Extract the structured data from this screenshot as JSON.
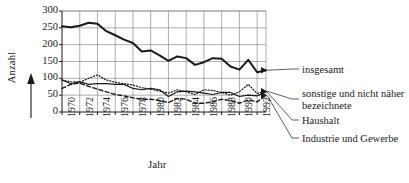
{
  "chart_data": {
    "type": "line",
    "title": "",
    "xlabel": "Jahr",
    "ylabel": "Anzahl",
    "xlim": [
      1970,
      1993
    ],
    "ylim": [
      0,
      300
    ],
    "yticks": [
      0,
      50,
      100,
      150,
      200,
      250,
      300
    ],
    "xticks": [
      1970,
      1972,
      1974,
      1976,
      1978,
      1980,
      1982,
      1984,
      1986,
      1988,
      1990,
      1992
    ],
    "grid": true,
    "legend_position": "right",
    "x": [
      1970,
      1971,
      1972,
      1973,
      1974,
      1975,
      1976,
      1977,
      1978,
      1979,
      1980,
      1981,
      1982,
      1983,
      1984,
      1985,
      1986,
      1987,
      1988,
      1989,
      1990,
      1991,
      1992,
      1993
    ],
    "series": [
      {
        "name": "insgesamt",
        "style": "solid-thick",
        "values": [
          255,
          252,
          256,
          265,
          262,
          240,
          228,
          215,
          205,
          180,
          183,
          168,
          152,
          165,
          160,
          140,
          148,
          160,
          158,
          135,
          126,
          155,
          118,
          124
        ]
      },
      {
        "name": "sonstige und nicht näher bezeichnete",
        "style": "dotted",
        "values": [
          95,
          90,
          88,
          100,
          110,
          95,
          88,
          84,
          80,
          72,
          68,
          62,
          56,
          66,
          60,
          52,
          66,
          64,
          58,
          50,
          60,
          82,
          55,
          62
        ]
      },
      {
        "name": "Haushalt",
        "style": "solid-thin",
        "values": [
          95,
          84,
          90,
          82,
          84,
          84,
          82,
          82,
          70,
          66,
          70,
          66,
          46,
          60,
          62,
          60,
          56,
          52,
          58,
          58,
          46,
          50,
          48,
          60
        ]
      },
      {
        "name": "Industrie und Gewerbe",
        "style": "dashed",
        "values": [
          70,
          82,
          86,
          76,
          68,
          60,
          52,
          48,
          42,
          38,
          38,
          34,
          28,
          40,
          38,
          26,
          26,
          30,
          38,
          34,
          26,
          36,
          30,
          50
        ]
      }
    ]
  },
  "axis": {
    "ylabel": "Anzahl",
    "xlabel": "Jahr",
    "yticks": [
      "300",
      "250",
      "200",
      "150",
      "100",
      "50",
      "0"
    ],
    "xticks": [
      "1970",
      "1972",
      "1974",
      "1976",
      "1978",
      "1980",
      "1982",
      "1984",
      "1986",
      "1988",
      "1990",
      "1992"
    ]
  },
  "legend": {
    "items": [
      {
        "label": "insgesamt"
      },
      {
        "label": "sonstige und nicht näher bezeichnete"
      },
      {
        "label": "Haushalt"
      },
      {
        "label": "Industrie und Gewerbe"
      }
    ]
  },
  "colors": {
    "ink": "#1a1a1a",
    "grid": "#8c8c8c",
    "background": "#ffffff"
  }
}
